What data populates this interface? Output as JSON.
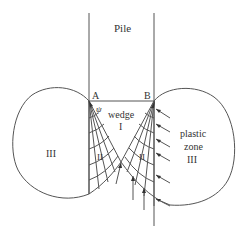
{
  "diagram": {
    "labels": {
      "pile": "Pile",
      "point_a": "A",
      "point_b": "B",
      "angle": "ψ",
      "wedge": "wedge",
      "wedge_zone": "I",
      "zone_ii_left": "II",
      "zone_ii_right": "II",
      "zone_iii_left": "III",
      "plastic": "plastic",
      "zone": "zone",
      "zone_iii_right": "III"
    },
    "colors": {
      "line": "#555555",
      "text": "#333333",
      "background": "#ffffff"
    }
  }
}
